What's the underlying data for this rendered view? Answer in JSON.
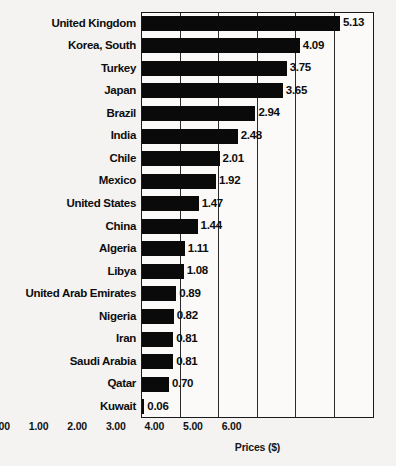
{
  "chart_data": {
    "type": "bar",
    "orientation": "horizontal",
    "title": "",
    "subtitle": "",
    "xlabel": "Prices ($)",
    "ylabel": "",
    "xlim": [
      0.0,
      6.0
    ],
    "xticks": [
      "0.00",
      "1.00",
      "2.00",
      "3.00",
      "4.00",
      "5.00",
      "6.00"
    ],
    "xtick_values": [
      0,
      1,
      2,
      3,
      4,
      5,
      6
    ],
    "grid": "vertical",
    "legend": "none",
    "bar_color": "#0a0a0a",
    "categories": [
      "United Kingdom",
      "Korea, South",
      "Turkey",
      "Japan",
      "Brazil",
      "India",
      "Chile",
      "Mexico",
      "United States",
      "China",
      "Algeria",
      "Libya",
      "United Arab Emirates",
      "Nigeria",
      "Iran",
      "Saudi Arabia",
      "Qatar",
      "Kuwait"
    ],
    "values": [
      5.13,
      4.09,
      3.75,
      3.65,
      2.94,
      2.48,
      2.01,
      1.92,
      1.47,
      1.44,
      1.11,
      1.08,
      0.89,
      0.82,
      0.81,
      0.81,
      0.7,
      0.06
    ],
    "value_labels": [
      "5.13",
      "4.09",
      "3.75",
      "3.65",
      "2.94",
      "2.48",
      "2.01",
      "1.92",
      "1.47",
      "1.44",
      "1.11",
      "1.08",
      "0.89",
      "0.82",
      "0.81",
      "0.81",
      "0.70",
      "0.06"
    ]
  }
}
